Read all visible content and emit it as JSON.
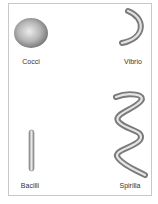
{
  "diagram": {
    "type": "bacteria-shapes",
    "items": [
      {
        "id": "cocci",
        "label": "Cocci",
        "shape": "sphere"
      },
      {
        "id": "vibrio",
        "label": "Vibrio",
        "shape": "comma"
      },
      {
        "id": "bacilli",
        "label": "Bacilli",
        "shape": "rod"
      },
      {
        "id": "spirilla",
        "label": "Spirilla",
        "shape": "spiral"
      }
    ],
    "colors": {
      "border": "#c8c8c8",
      "shape_dark": "#7a7a7a",
      "shape_light": "#e6e6e6",
      "label": "#333333"
    }
  }
}
